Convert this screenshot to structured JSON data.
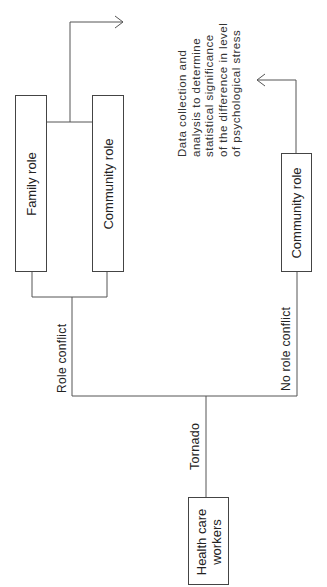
{
  "diagram": {
    "start_node": {
      "label_line1": "Health care",
      "label_line2": "workers"
    },
    "event_label": "Tornado",
    "branch_conflict": {
      "label": "Role conflict",
      "nodes": [
        {
          "label": "Family role"
        },
        {
          "label": "Community role"
        }
      ]
    },
    "branch_no_conflict": {
      "label": "No role conflict",
      "nodes": [
        {
          "label": "Community role"
        }
      ]
    },
    "outcome": {
      "lines": [
        "Data collection and",
        "analysis to determine",
        "statistical significance",
        "of the difference in level",
        "of psychological stress"
      ]
    },
    "orientation": "rotated -90deg (page in landscape)",
    "colors": {
      "line": "#444444",
      "text": "#222222",
      "background": "#ffffff"
    }
  }
}
